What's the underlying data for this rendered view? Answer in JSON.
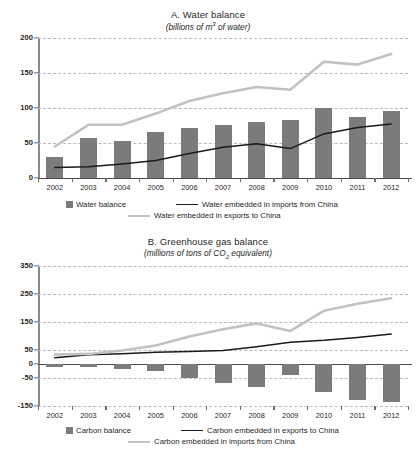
{
  "colors": {
    "bar": "#7b7b7b",
    "dark_line": "#1a1a1a",
    "light_line": "#c2c2c2",
    "gridline": "#b9b9c8",
    "axis": "#6d6d6d"
  },
  "panels": [
    {
      "id": "A",
      "title": "A. Water balance",
      "subtitle_prefix": "(billions of m",
      "subtitle_sup": "3",
      "subtitle_suffix": " of water)",
      "legend": {
        "bar_label": "Water balance",
        "dark_line_label": "Water embedded in imports from China",
        "light_line_label": "Water embedded in exports to China"
      }
    },
    {
      "id": "B",
      "title": "B. Greenhouse gas balance",
      "subtitle_prefix": "(millions of tons of CO",
      "subtitle_sub": "2",
      "subtitle_suffix": " equivalent)",
      "legend": {
        "bar_label": "Carbon balance",
        "dark_line_label": "Carbon embedded in exports to China",
        "light_line_label": "Carbon embedded in imports from China"
      }
    }
  ],
  "chart_data": [
    {
      "type": "bar",
      "panel": "A",
      "title": "A. Water balance",
      "subtitle": "(billions of m3 of water)",
      "xlabel": "",
      "ylabel": "",
      "ylim": [
        0,
        200
      ],
      "yticks": [
        0,
        50,
        100,
        150,
        200
      ],
      "ytick_labels": [
        "0",
        "50",
        "100",
        "150",
        "200"
      ],
      "grid": true,
      "legend_position": "bottom",
      "categories": [
        "2002",
        "2003",
        "2004",
        "2005",
        "2006",
        "2007",
        "2008",
        "2009",
        "2010",
        "2011",
        "2012"
      ],
      "series": [
        {
          "name": "Water balance",
          "type": "bar",
          "color": "#7b7b7b",
          "values": [
            29,
            57,
            53,
            66,
            71,
            76,
            80,
            83,
            100,
            87,
            96
          ]
        },
        {
          "name": "Water embedded in imports from China",
          "type": "line",
          "color": "#1a1a1a",
          "values": [
            15,
            16,
            20,
            25,
            35,
            44,
            49,
            42,
            63,
            72,
            77
          ]
        },
        {
          "name": "Water embedded in exports to China",
          "type": "line",
          "color": "#c2c2c2",
          "values": [
            45,
            76,
            76,
            92,
            110,
            121,
            130,
            126,
            166,
            162,
            177
          ]
        }
      ]
    },
    {
      "type": "bar",
      "panel": "B",
      "title": "B. Greenhouse gas balance",
      "subtitle": "(millions of tons of CO2 equivalent)",
      "xlabel": "",
      "ylabel": "",
      "ylim": [
        -150,
        350
      ],
      "yticks": [
        -150,
        -50,
        0,
        50,
        150,
        250,
        350
      ],
      "ytick_labels": [
        "-150",
        "-50",
        "0",
        "50",
        "150",
        "250",
        "350"
      ],
      "grid": true,
      "legend_position": "bottom",
      "categories": [
        "2002",
        "2003",
        "2004",
        "2005",
        "2006",
        "2007",
        "2008",
        "2009",
        "2010",
        "2011",
        "2012"
      ],
      "series": [
        {
          "name": "Carbon balance",
          "type": "bar",
          "color": "#7b7b7b",
          "values": [
            -13,
            -11,
            -20,
            -26,
            -52,
            -68,
            -82,
            -40,
            -101,
            -130,
            -138
          ]
        },
        {
          "name": "Carbon embedded in exports to China",
          "type": "line",
          "color": "#1a1a1a",
          "values": [
            22,
            33,
            37,
            42,
            45,
            48,
            62,
            78,
            85,
            95,
            107
          ]
        },
        {
          "name": "Carbon embedded in imports from China",
          "type": "line",
          "color": "#c2c2c2",
          "values": [
            34,
            36,
            48,
            66,
            98,
            124,
            145,
            118,
            190,
            215,
            235
          ]
        }
      ]
    }
  ]
}
